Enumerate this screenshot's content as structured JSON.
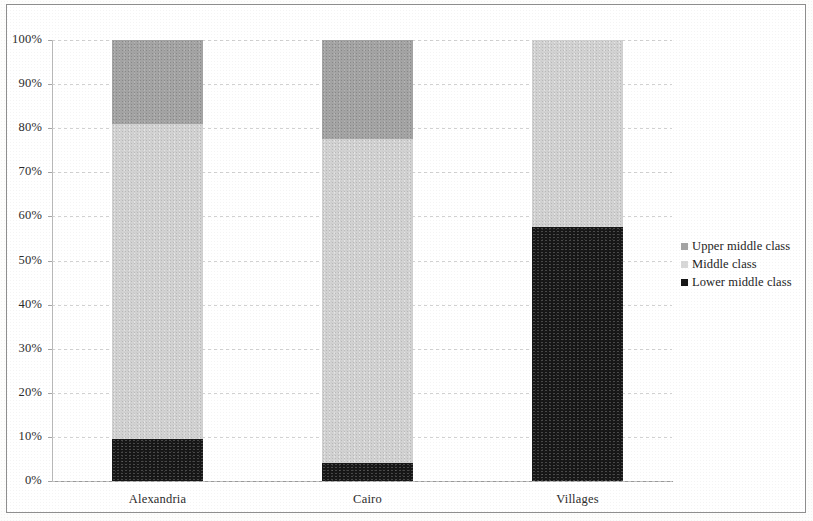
{
  "chart_data": {
    "type": "bar",
    "subtype": "stacked-bar-100-percent",
    "title": "",
    "subtitle": "",
    "xlabel": "",
    "ylabel": "",
    "categories": [
      "Alexandria",
      "Cairo",
      "Villages"
    ],
    "series": [
      {
        "name": "Lower middle class",
        "color": "#161616",
        "values": [
          9.5,
          4.0,
          57.5
        ]
      },
      {
        "name": "Middle class",
        "color": "#d2d2d2",
        "values": [
          71.5,
          73.5,
          42.5
        ]
      },
      {
        "name": "Upper middle class",
        "color": "#a4a4a4",
        "values": [
          19.0,
          22.5,
          0.0
        ]
      }
    ],
    "stack_order_bottom_to_top": [
      "Lower middle class",
      "Middle class",
      "Upper middle class"
    ],
    "cumulative_boundaries_percent": {
      "Alexandria": {
        "lower_top": 9.5,
        "middle_top": 81.0,
        "upper_top": 100.0
      },
      "Cairo": {
        "lower_top": 4.0,
        "middle_top": 77.5,
        "upper_top": 100.0
      },
      "Villages": {
        "lower_top": 57.5,
        "middle_top": 100.0,
        "upper_top": 100.0
      }
    },
    "ylim": [
      0,
      100
    ],
    "ytick_values": [
      0,
      10,
      20,
      30,
      40,
      50,
      60,
      70,
      80,
      90,
      100
    ],
    "ytick_labels": [
      "0%",
      "10%",
      "20%",
      "30%",
      "40%",
      "50%",
      "60%",
      "70%",
      "80%",
      "90%",
      "100%"
    ],
    "grid": true,
    "grid_axis": "y",
    "grid_style": "dashed",
    "legend_position": "right",
    "legend_entries": [
      "Upper middle class",
      "Middle class",
      "Lower middle class"
    ]
  },
  "legend": {
    "items": [
      {
        "label": "Upper middle class",
        "swatch": "upper-middle-class-swatch"
      },
      {
        "label": "Middle class",
        "swatch": "middle-class-swatch"
      },
      {
        "label": "Lower middle class",
        "swatch": "lower-middle-class-swatch"
      }
    ]
  },
  "axes": {
    "y": {
      "labels": [
        "100%",
        "90%",
        "80%",
        "70%",
        "60%",
        "50%",
        "40%",
        "30%",
        "20%",
        "10%",
        "0%"
      ]
    },
    "x": {
      "labels": [
        "Alexandria",
        "Cairo",
        "Villages"
      ]
    }
  },
  "colors": {
    "upper_middle_class": "#a4a4a4",
    "middle_class": "#d2d2d2",
    "lower_middle_class": "#161616",
    "gridline": "#c9c9c9",
    "axis": "#9a9a9a",
    "frame": "#8e8e8e",
    "text": "#2b2b2b",
    "background": "#ffffff"
  }
}
